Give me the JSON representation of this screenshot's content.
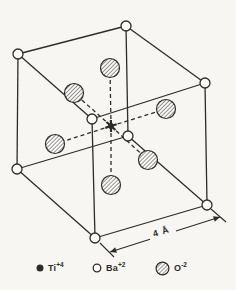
{
  "figure": {
    "name": "perovskite-unit-cell",
    "ink_color": "#2e2c29",
    "paper_color": "#f7f6f2",
    "atom_fill": "#fcfbf9"
  },
  "diagram": {
    "canvas": {
      "w": 236,
      "h": 290
    },
    "ba_radius": 5,
    "o_radius": 9.5,
    "corners": {
      "top_back": [
        126,
        26
      ],
      "top_left": [
        18,
        54
      ],
      "top_front": [
        92,
        119
      ],
      "top_right": [
        205,
        83
      ],
      "bottom_left": [
        17,
        169
      ],
      "bottom_front": [
        95,
        238
      ],
      "bottom_right": [
        207,
        205
      ],
      "bottom_back": [
        128,
        136
      ]
    },
    "edges": [
      [
        "top_left",
        "top_back"
      ],
      [
        "top_back",
        "top_right"
      ],
      [
        "top_left",
        "top_front"
      ],
      [
        "top_front",
        "top_right"
      ],
      [
        "top_left",
        "bottom_left"
      ],
      [
        "top_back",
        "bottom_back"
      ],
      [
        "top_front",
        "bottom_front"
      ],
      [
        "top_right",
        "bottom_right"
      ],
      [
        "bottom_left",
        "bottom_front"
      ],
      [
        "bottom_front",
        "bottom_right"
      ],
      [
        "bottom_left",
        "bottom_back"
      ],
      [
        "bottom_back",
        "bottom_right"
      ]
    ],
    "oxygen_face_centers": [
      [
        110,
        68
      ],
      [
        74,
        93
      ],
      [
        166,
        109
      ],
      [
        55,
        144
      ],
      [
        148,
        160
      ],
      [
        111,
        185
      ]
    ],
    "titanium_center": [
      111,
      126
    ],
    "dimension": {
      "label": "4 Å",
      "from": [
        110,
        252
      ],
      "to": [
        220,
        217
      ],
      "label_gap_x": [
        150,
        176
      ],
      "label_anchor": [
        162,
        234.5
      ],
      "rotation_deg": -17.6,
      "extension_lines": [
        [
          [
            100,
            243
          ],
          [
            114,
            257
          ]
        ],
        [
          [
            211,
            209
          ],
          [
            226,
            222
          ]
        ]
      ]
    }
  },
  "legend": {
    "items": [
      {
        "marker": "filled-dot",
        "symbol": "Ti",
        "charge": "+4"
      },
      {
        "marker": "open-circle",
        "symbol": "Ba",
        "charge": "+2"
      },
      {
        "marker": "hatched-circle",
        "symbol": "O",
        "charge": "-2"
      }
    ]
  }
}
